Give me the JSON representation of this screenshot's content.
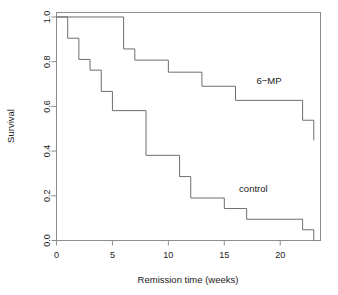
{
  "chart_data": {
    "type": "line",
    "subtype": "kaplan-meier-step",
    "title": "",
    "xlabel": "Remission time (weeks)",
    "ylabel": "Survival",
    "xlim": [
      0,
      23.6
    ],
    "ylim": [
      0.0,
      1.02
    ],
    "xticks": [
      0,
      5,
      10,
      15,
      20
    ],
    "xtick_labels": [
      "0",
      "5",
      "10",
      "15",
      "20"
    ],
    "yticks": [
      0.0,
      0.2,
      0.4,
      0.6,
      0.8,
      1.0
    ],
    "ytick_labels": [
      "0.0",
      "0.2",
      "0.4",
      "0.6",
      "0.8",
      "1.0"
    ],
    "grid": false,
    "legend": "inline-annotations",
    "frame": "box",
    "series": [
      {
        "name": "6-MP",
        "label": "6−MP",
        "color": "#6e6e6e",
        "label_x": 19.0,
        "label_y": 0.7,
        "x": [
          0,
          6,
          6,
          7,
          7,
          10,
          10,
          13,
          13,
          16,
          16,
          22,
          22,
          23,
          23
        ],
        "y": [
          1.0,
          1.0,
          0.857,
          0.857,
          0.807,
          0.807,
          0.753,
          0.753,
          0.69,
          0.69,
          0.627,
          0.627,
          0.538,
          0.538,
          0.448
        ],
        "steps": [
          {
            "time": 0,
            "survival": 1.0
          },
          {
            "time": 6,
            "survival": 0.857
          },
          {
            "time": 7,
            "survival": 0.807
          },
          {
            "time": 10,
            "survival": 0.753
          },
          {
            "time": 13,
            "survival": 0.69
          },
          {
            "time": 16,
            "survival": 0.627
          },
          {
            "time": 22,
            "survival": 0.538
          },
          {
            "time": 23,
            "survival": 0.448
          }
        ]
      },
      {
        "name": "control",
        "label": "control",
        "color": "#6e6e6e",
        "label_x": 17.6,
        "label_y": 0.215,
        "x": [
          0,
          1,
          1,
          2,
          2,
          3,
          3,
          4,
          4,
          5,
          5,
          8,
          8,
          11,
          11,
          12,
          12,
          15,
          15,
          17,
          17,
          22,
          22,
          23,
          23
        ],
        "y": [
          1.0,
          1.0,
          0.905,
          0.905,
          0.81,
          0.81,
          0.762,
          0.762,
          0.667,
          0.667,
          0.581,
          0.581,
          0.381,
          0.381,
          0.286,
          0.286,
          0.19,
          0.19,
          0.143,
          0.143,
          0.095,
          0.095,
          0.048,
          0.048,
          0.0
        ],
        "steps": [
          {
            "time": 0,
            "survival": 1.0
          },
          {
            "time": 1,
            "survival": 0.905
          },
          {
            "time": 2,
            "survival": 0.81
          },
          {
            "time": 3,
            "survival": 0.762
          },
          {
            "time": 4,
            "survival": 0.667
          },
          {
            "time": 5,
            "survival": 0.581
          },
          {
            "time": 8,
            "survival": 0.381
          },
          {
            "time": 11,
            "survival": 0.286
          },
          {
            "time": 12,
            "survival": 0.19
          },
          {
            "time": 15,
            "survival": 0.143
          },
          {
            "time": 17,
            "survival": 0.095
          },
          {
            "time": 22,
            "survival": 0.048
          },
          {
            "time": 23,
            "survival": 0.0
          }
        ]
      }
    ]
  }
}
